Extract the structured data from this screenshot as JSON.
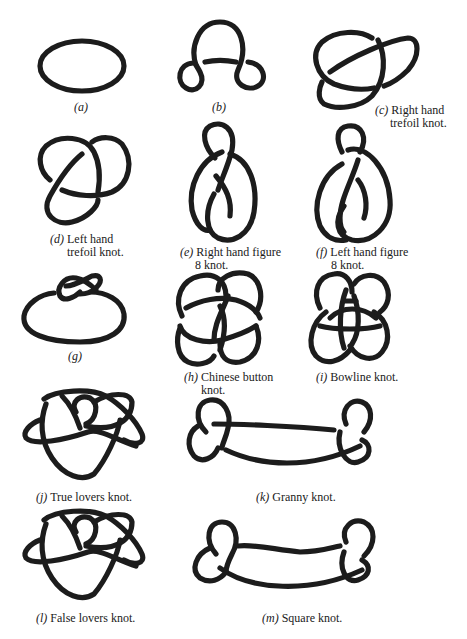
{
  "figure": {
    "panels": [
      {
        "id": "a",
        "letter": "(a)",
        "text": "",
        "text2": ""
      },
      {
        "id": "b",
        "letter": "(b)",
        "text": "",
        "text2": ""
      },
      {
        "id": "c",
        "letter": "(c)",
        "text": "Right hand",
        "text2": "trefoil knot."
      },
      {
        "id": "d",
        "letter": "(d)",
        "text": "Left hand",
        "text2": "trefoil knot."
      },
      {
        "id": "e",
        "letter": "(e)",
        "text": "Right hand figure",
        "text2": "8 knot."
      },
      {
        "id": "f",
        "letter": "(f)",
        "text": "Left hand figure",
        "text2": "8 knot."
      },
      {
        "id": "g",
        "letter": "(g)",
        "text": "",
        "text2": ""
      },
      {
        "id": "h",
        "letter": "(h)",
        "text": "Chinese button",
        "text2": "knot."
      },
      {
        "id": "i",
        "letter": "(i)",
        "text": "Bowline knot.",
        "text2": ""
      },
      {
        "id": "j",
        "letter": "(j)",
        "text": "True lovers knot.",
        "text2": ""
      },
      {
        "id": "k",
        "letter": "(k)",
        "text": "Granny knot.",
        "text2": ""
      },
      {
        "id": "l",
        "letter": "(l)",
        "text": "False lovers knot.",
        "text2": ""
      },
      {
        "id": "m",
        "letter": "(m)",
        "text": "Square knot.",
        "text2": ""
      }
    ]
  },
  "colors": {
    "background": "#ffffff",
    "stroke": "#1c1c1c"
  }
}
